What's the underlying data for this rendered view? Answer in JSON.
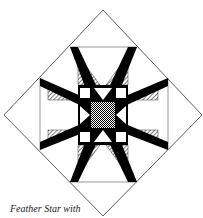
{
  "figure": {
    "caption": "Feather Star with",
    "colors": {
      "line": "#333333",
      "fill_dark": "#000000",
      "fill_light": "#ffffff",
      "fill_hatch": "#888888"
    }
  }
}
